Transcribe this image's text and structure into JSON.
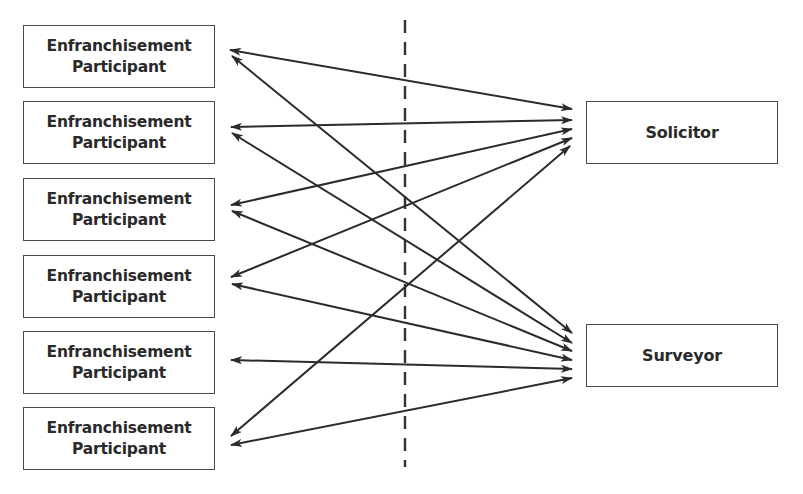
{
  "diagram": {
    "participants": [
      {
        "line1": "Enfranchisement",
        "line2": "Participant"
      },
      {
        "line1": "Enfranchisement",
        "line2": "Participant"
      },
      {
        "line1": "Enfranchisement",
        "line2": "Participant"
      },
      {
        "line1": "Enfranchisement",
        "line2": "Participant"
      },
      {
        "line1": "Enfranchisement",
        "line2": "Participant"
      },
      {
        "line1": "Enfranchisement",
        "line2": "Participant"
      }
    ],
    "advisors": [
      {
        "label": "Solicitor"
      },
      {
        "label": "Surveyor"
      }
    ],
    "connections": [
      {
        "from": "participant-1",
        "to": "Solicitor",
        "direction": "bidirectional"
      },
      {
        "from": "participant-1",
        "to": "Surveyor",
        "direction": "bidirectional"
      },
      {
        "from": "participant-2",
        "to": "Solicitor",
        "direction": "bidirectional"
      },
      {
        "from": "participant-2",
        "to": "Surveyor",
        "direction": "bidirectional"
      },
      {
        "from": "participant-3",
        "to": "Solicitor",
        "direction": "bidirectional"
      },
      {
        "from": "participant-3",
        "to": "Surveyor",
        "direction": "bidirectional"
      },
      {
        "from": "participant-4",
        "to": "Solicitor",
        "direction": "bidirectional"
      },
      {
        "from": "participant-4",
        "to": "Surveyor",
        "direction": "bidirectional"
      },
      {
        "from": "participant-5",
        "to": "Surveyor",
        "direction": "bidirectional"
      },
      {
        "from": "participant-6",
        "to": "Solicitor",
        "direction": "bidirectional"
      },
      {
        "from": "participant-6",
        "to": "Surveyor",
        "direction": "bidirectional"
      }
    ],
    "divider": {
      "style": "dashed",
      "orientation": "vertical"
    },
    "colors": {
      "line": "#2b2b2b",
      "text": "#2a2a2a",
      "border": "#4a4a4a",
      "background": "#ffffff"
    }
  }
}
